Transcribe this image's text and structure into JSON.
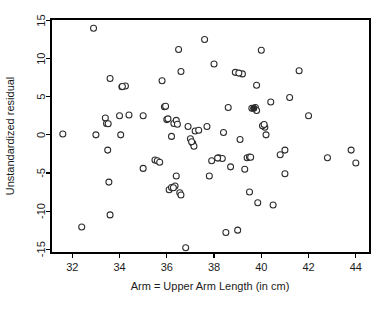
{
  "chart_data": {
    "type": "scatter",
    "title": "",
    "xlabel": "Arm = Upper Arm Length (in cm)",
    "ylabel": "Unstandardized residual",
    "xlim": [
      31.1,
      44.6
    ],
    "ylim": [
      -15.5,
      15.2
    ],
    "xticks": [
      32,
      34,
      36,
      38,
      40,
      42,
      44
    ],
    "yticks": [
      15,
      10,
      5,
      0,
      -5,
      -10,
      -15
    ],
    "xtick_labels": [
      "32",
      "34",
      "36",
      "38",
      "40",
      "42",
      "44"
    ],
    "ytick_labels": [
      "15",
      "10",
      "5",
      "0",
      "-5",
      "-10",
      "-15"
    ],
    "grid": false,
    "legend": false,
    "marker": "open-circle",
    "marker_color": "#2b2b2b",
    "marker_fill": "#ffffff",
    "n_points": 95,
    "points": [
      {
        "x": 31.6,
        "y": 0.1
      },
      {
        "x": 32.4,
        "y": -12.1
      },
      {
        "x": 32.9,
        "y": 14.0
      },
      {
        "x": 33.0,
        "y": 0.0
      },
      {
        "x": 33.4,
        "y": 2.2
      },
      {
        "x": 33.45,
        "y": 1.5
      },
      {
        "x": 33.5,
        "y": -2.0
      },
      {
        "x": 33.55,
        "y": -6.2
      },
      {
        "x": 33.6,
        "y": 7.4
      },
      {
        "x": 33.6,
        "y": -10.5
      },
      {
        "x": 34.0,
        "y": 2.5
      },
      {
        "x": 34.05,
        "y": 0.0
      },
      {
        "x": 34.1,
        "y": 6.3
      },
      {
        "x": 34.25,
        "y": 6.4
      },
      {
        "x": 35.0,
        "y": 2.5
      },
      {
        "x": 35.0,
        "y": -4.4
      },
      {
        "x": 35.5,
        "y": -3.3
      },
      {
        "x": 35.6,
        "y": -3.4
      },
      {
        "x": 35.7,
        "y": -3.6
      },
      {
        "x": 35.8,
        "y": 7.1
      },
      {
        "x": 35.9,
        "y": 3.7
      },
      {
        "x": 36.0,
        "y": 2.0
      },
      {
        "x": 36.1,
        "y": -7.2
      },
      {
        "x": 36.2,
        "y": -0.2
      },
      {
        "x": 36.2,
        "y": -6.9
      },
      {
        "x": 36.3,
        "y": 1.5
      },
      {
        "x": 36.35,
        "y": -6.7
      },
      {
        "x": 36.4,
        "y": 1.9
      },
      {
        "x": 36.4,
        "y": -5.4
      },
      {
        "x": 36.5,
        "y": 11.2
      },
      {
        "x": 36.55,
        "y": -7.6
      },
      {
        "x": 36.6,
        "y": -7.9
      },
      {
        "x": 36.6,
        "y": 8.3
      },
      {
        "x": 36.8,
        "y": -14.8
      },
      {
        "x": 36.9,
        "y": 1.1
      },
      {
        "x": 37.0,
        "y": -0.5
      },
      {
        "x": 37.1,
        "y": -1.1
      },
      {
        "x": 37.15,
        "y": -1.5
      },
      {
        "x": 37.2,
        "y": 0.5
      },
      {
        "x": 37.6,
        "y": 12.5
      },
      {
        "x": 37.7,
        "y": 1.1
      },
      {
        "x": 37.8,
        "y": -5.4
      },
      {
        "x": 37.9,
        "y": -3.4
      },
      {
        "x": 38.0,
        "y": 9.3
      },
      {
        "x": 38.2,
        "y": -3.0
      },
      {
        "x": 38.4,
        "y": 0.3
      },
      {
        "x": 38.5,
        "y": -12.8
      },
      {
        "x": 38.6,
        "y": 3.6
      },
      {
        "x": 38.7,
        "y": -4.2
      },
      {
        "x": 38.9,
        "y": 8.2
      },
      {
        "x": 39.0,
        "y": -12.5
      },
      {
        "x": 39.1,
        "y": -0.6
      },
      {
        "x": 39.2,
        "y": 8.0
      },
      {
        "x": 39.3,
        "y": -4.5
      },
      {
        "x": 39.4,
        "y": -3.0
      },
      {
        "x": 39.5,
        "y": -2.9
      },
      {
        "x": 39.5,
        "y": -7.5
      },
      {
        "x": 39.6,
        "y": 3.5
      },
      {
        "x": 39.7,
        "y": 3.5
      },
      {
        "x": 39.75,
        "y": 3.6
      },
      {
        "x": 39.8,
        "y": 3.2
      },
      {
        "x": 39.8,
        "y": 6.5
      },
      {
        "x": 39.85,
        "y": -8.9
      },
      {
        "x": 40.0,
        "y": 11.1
      },
      {
        "x": 40.1,
        "y": 1.3
      },
      {
        "x": 40.15,
        "y": 1.0
      },
      {
        "x": 40.2,
        "y": 0.0
      },
      {
        "x": 40.4,
        "y": 4.3
      },
      {
        "x": 40.5,
        "y": -9.2
      },
      {
        "x": 40.8,
        "y": -2.6
      },
      {
        "x": 41.0,
        "y": -2.0
      },
      {
        "x": 41.0,
        "y": -5.1
      },
      {
        "x": 41.2,
        "y": 4.9
      },
      {
        "x": 41.6,
        "y": 8.4
      },
      {
        "x": 42.0,
        "y": 2.5
      },
      {
        "x": 42.8,
        "y": -3.0
      },
      {
        "x": 43.8,
        "y": -2.0
      },
      {
        "x": 44.0,
        "y": -3.7
      },
      {
        "x": 34.4,
        "y": 2.6
      },
      {
        "x": 36.05,
        "y": 2.1
      },
      {
        "x": 37.35,
        "y": 0.6
      },
      {
        "x": 38.35,
        "y": -3.1
      },
      {
        "x": 39.05,
        "y": 8.1
      },
      {
        "x": 40.05,
        "y": 1.2
      },
      {
        "x": 35.95,
        "y": 3.75
      },
      {
        "x": 33.52,
        "y": 1.45
      },
      {
        "x": 36.45,
        "y": 1.4
      },
      {
        "x": 37.05,
        "y": -0.9
      },
      {
        "x": 38.15,
        "y": -3.05
      },
      {
        "x": 39.55,
        "y": -2.95
      },
      {
        "x": 40.12,
        "y": 1.35
      },
      {
        "x": 36.28,
        "y": -6.95
      },
      {
        "x": 34.12,
        "y": 6.35
      }
    ],
    "overlap_points": [
      {
        "x": 39.68,
        "y": 3.5,
        "style": "dark"
      }
    ]
  },
  "layout": {
    "plot_left": 51,
    "plot_right": 370,
    "plot_top": 19,
    "plot_bottom": 253,
    "marker_radius": 3.0
  }
}
